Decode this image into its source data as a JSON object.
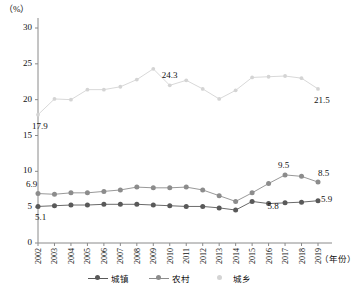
{
  "chart_data": {
    "type": "line",
    "title": "",
    "xlabel": "年份",
    "ylabel": "%",
    "y_unit_label": "（%）",
    "x_axis_name": "（年份）",
    "ylim": [
      0,
      30
    ],
    "yticks": [
      0,
      5,
      10,
      15,
      20,
      25,
      30
    ],
    "grid": false,
    "legend_position": "bottom",
    "categories": [
      "2002",
      "2003",
      "2004",
      "2005",
      "2006",
      "2007",
      "2008",
      "2009",
      "2010",
      "2011",
      "2012",
      "2013",
      "2014",
      "2015",
      "2016",
      "2017",
      "2018",
      "2019"
    ],
    "series": [
      {
        "name": "城镇",
        "color": "#595959",
        "values": [
          5.1,
          5.2,
          5.3,
          5.3,
          5.4,
          5.4,
          5.4,
          5.3,
          5.2,
          5.1,
          5.1,
          4.9,
          4.6,
          5.8,
          5.5,
          5.6,
          5.7,
          5.9
        ],
        "labels": [
          {
            "index": 0,
            "value": "5.1"
          },
          {
            "index": 14,
            "value": "5.8"
          },
          {
            "index": 17,
            "value": "5.9"
          }
        ]
      },
      {
        "name": "农村",
        "color": "#8c8c8c",
        "values": [
          6.9,
          6.8,
          7.0,
          7.0,
          7.2,
          7.4,
          7.8,
          7.7,
          7.7,
          7.8,
          7.4,
          6.6,
          5.8,
          7.0,
          8.3,
          9.5,
          9.3,
          8.5
        ],
        "labels": [
          {
            "index": 0,
            "value": "6.9"
          },
          {
            "index": 15,
            "value": "9.5"
          },
          {
            "index": 17,
            "value": "8.5"
          }
        ]
      },
      {
        "name": "城乡",
        "color": "#d4d4d4",
        "values": [
          17.9,
          20.1,
          20.0,
          21.4,
          21.4,
          21.8,
          22.8,
          24.3,
          22.0,
          22.7,
          21.5,
          20.1,
          21.3,
          23.1,
          23.2,
          23.3,
          23.0,
          21.5
        ],
        "labels": [
          {
            "index": 0,
            "value": "17.9"
          },
          {
            "index": 8,
            "value": "24.3"
          },
          {
            "index": 17,
            "value": "21.5"
          }
        ]
      }
    ]
  },
  "legend": {
    "items": [
      {
        "label": "城镇",
        "color": "#595959",
        "has_line": true
      },
      {
        "label": "农村",
        "color": "#8c8c8c",
        "has_line": true
      },
      {
        "label": "城乡",
        "color": "#d4d4d4",
        "has_line": false
      }
    ]
  }
}
